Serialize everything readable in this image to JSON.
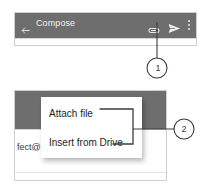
{
  "figure": {
    "type": "annotated-ui-screenshot",
    "callouts": [
      {
        "id": "1",
        "label": "1",
        "target": "attach-icon"
      },
      {
        "id": "2",
        "label": "2",
        "target": "attachment-menu"
      }
    ]
  },
  "top_panel": {
    "appbar": {
      "back_icon": "back-arrow-icon",
      "title": "Compose",
      "attach_icon": "paperclip-icon",
      "send_icon": "send-paper-plane-icon",
      "more_icon": "overflow-menu-icon"
    }
  },
  "bottom_panel": {
    "recipient_text": "fect@",
    "menu": {
      "items": [
        {
          "label": "Attach file"
        },
        {
          "label": "Insert from Drive"
        }
      ]
    }
  },
  "colors": {
    "appbar": "#6e6e6e",
    "appbar_text": "#f2f2f2",
    "menu_text": "#1d1d1d",
    "callout_line": "#3c3c3c",
    "panel_border": "#cfcfcf"
  }
}
